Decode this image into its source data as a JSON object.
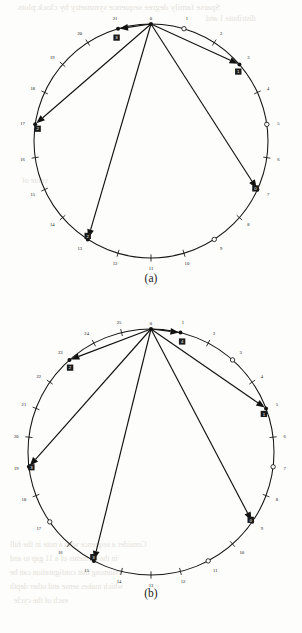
{
  "page": {
    "bleed_through_text": [
      {
        "text": "Sparse family degree sequence symmetry by clock plots",
        "x": 18,
        "y": 2,
        "size": 9
      },
      {
        "text": "distribute 1 and",
        "x": 206,
        "y": 14,
        "size": 8
      },
      {
        "text": "each of the cycle",
        "x": 14,
        "y": 596,
        "size": 8
      },
      {
        "text": "which makes sense and other depth",
        "x": 10,
        "y": 582,
        "size": 8
      },
      {
        "text": "Assuming that configuration can be",
        "x": 10,
        "y": 568,
        "size": 8
      },
      {
        "text": "in the elements of a 11 gap to and",
        "x": 10,
        "y": 554,
        "size": 8
      },
      {
        "text": "Consider a sequence with a note in the full",
        "x": 10,
        "y": 540,
        "size": 8
      },
      {
        "text": "value of",
        "x": 22,
        "y": 176,
        "size": 8
      }
    ]
  },
  "figures": [
    {
      "id": "a",
      "caption": "(a)",
      "n_positions": 22,
      "center": {
        "x": 151,
        "y": 141
      },
      "radius": 117,
      "tick_labels": [
        "0",
        "1",
        "2",
        "3",
        "4",
        "5",
        "6",
        "7",
        "8",
        "9",
        "10",
        "11",
        "12",
        "13",
        "14",
        "15",
        "16",
        "17",
        "18",
        "19",
        "20",
        "21"
      ],
      "open_circle_positions": [
        1,
        5,
        9
      ],
      "filled_positions": [
        0,
        3,
        7,
        13,
        17,
        21
      ],
      "arrows": [
        {
          "from": 0,
          "to": 21,
          "label": "3"
        },
        {
          "from": 0,
          "to": 3,
          "label": "1"
        },
        {
          "from": 0,
          "to": 7,
          "label": "0"
        },
        {
          "from": 0,
          "to": 13,
          "label": "2"
        },
        {
          "from": 0,
          "to": 17,
          "label": "2"
        }
      ]
    },
    {
      "id": "b",
      "caption": "(b)",
      "n_positions": 26,
      "center": {
        "x": 151,
        "y": 152
      },
      "radius": 123,
      "tick_labels": [
        "0",
        "1",
        "2",
        "3",
        "4",
        "5",
        "6",
        "7",
        "8",
        "9",
        "10",
        "11",
        "12",
        "13",
        "14",
        "15",
        "16",
        "17",
        "18",
        "19",
        "20",
        "21",
        "22",
        "23",
        "24",
        "25"
      ],
      "open_circle_positions": [
        3,
        7,
        11,
        17
      ],
      "filled_positions": [
        0,
        1,
        5,
        9,
        15,
        19,
        23
      ],
      "arrows": [
        {
          "from": 0,
          "to": 1,
          "label": "4"
        },
        {
          "from": 0,
          "to": 5,
          "label": "1"
        },
        {
          "from": 0,
          "to": 9,
          "label": "0"
        },
        {
          "from": 0,
          "to": 15,
          "label": "3"
        },
        {
          "from": 0,
          "to": 19,
          "label": "3"
        },
        {
          "from": 0,
          "to": 23,
          "label": "2"
        }
      ]
    }
  ],
  "chart_data": {
    "type": "scatter",
    "title": "",
    "xlabel": "",
    "ylabel": "",
    "panels": [
      {
        "name": "(a)",
        "modulus": 22,
        "tick_positions": [
          0,
          1,
          2,
          3,
          4,
          5,
          6,
          7,
          8,
          9,
          10,
          11,
          12,
          13,
          14,
          15,
          16,
          17,
          18,
          19,
          20,
          21
        ],
        "open_markers": [
          1,
          5,
          9
        ],
        "filled_markers": [
          0,
          3,
          7,
          13,
          17,
          21
        ],
        "arrow_targets": [
          21,
          3,
          7,
          13,
          17
        ],
        "arrow_labels": [
          "3",
          "1",
          "0",
          "2",
          "2"
        ]
      },
      {
        "name": "(b)",
        "modulus": 26,
        "tick_positions": [
          0,
          1,
          2,
          3,
          4,
          5,
          6,
          7,
          8,
          9,
          10,
          11,
          12,
          13,
          14,
          15,
          16,
          17,
          18,
          19,
          20,
          21,
          22,
          23,
          24,
          25
        ],
        "open_markers": [
          3,
          7,
          11,
          17
        ],
        "filled_markers": [
          0,
          1,
          5,
          9,
          15,
          19,
          23
        ],
        "arrow_targets": [
          1,
          5,
          9,
          15,
          19,
          23
        ],
        "arrow_labels": [
          "4",
          "1",
          "0",
          "3",
          "3",
          "2"
        ]
      }
    ]
  }
}
